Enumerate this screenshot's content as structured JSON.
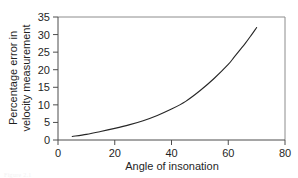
{
  "figure": {
    "background_color": "#ffffff",
    "frame_color": "#8c8c8c",
    "axis_color": "#4d4d4d",
    "curve_color": "#262626",
    "caption_fragment": "Figure 2.1"
  },
  "chart_data": {
    "type": "line",
    "title": "",
    "xlabel": "Angle of insonation",
    "ylabel": "Percentage error in velocity measurement",
    "ylabel_line1": "Percentage error in",
    "ylabel_line2": "velocity measurement",
    "xlim": [
      0,
      80
    ],
    "ylim": [
      0,
      35
    ],
    "xticks": [
      0,
      20,
      40,
      60,
      80
    ],
    "yticks": [
      0,
      5,
      10,
      15,
      20,
      25,
      30,
      35
    ],
    "xtick_labels": [
      "0",
      "20",
      "40",
      "60",
      "80"
    ],
    "ytick_labels": [
      "0",
      "5",
      "10",
      "15",
      "20",
      "25",
      "30",
      "35"
    ],
    "grid": false,
    "legend": false,
    "legend_position": "none",
    "series": [
      {
        "name": "Percentage error in velocity measurement",
        "x": [
          5,
          10,
          15,
          20,
          25,
          30,
          35,
          40,
          45,
          50,
          55,
          60,
          62,
          64,
          66,
          68,
          70
        ],
        "values": [
          1.0,
          1.6,
          2.4,
          3.3,
          4.3,
          5.5,
          7.0,
          8.8,
          11.0,
          14.0,
          17.5,
          21.5,
          23.5,
          25.5,
          27.5,
          29.7,
          32.0
        ]
      }
    ],
    "annotations": []
  }
}
